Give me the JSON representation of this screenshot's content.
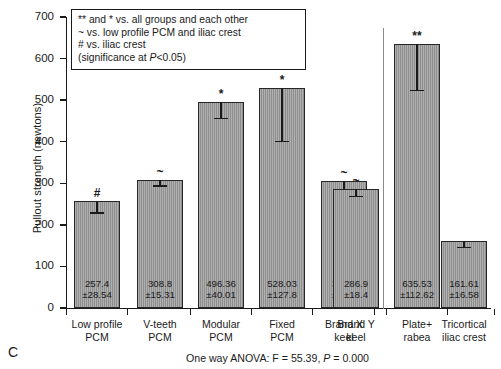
{
  "panel": {
    "letter": "C"
  },
  "chart_data": {
    "type": "bar",
    "title": "",
    "xlabel": "",
    "ylabel": "Pullout strength (newtons)",
    "ylim": [
      0,
      700
    ],
    "ytick_step": 100,
    "yticks": [
      0,
      100,
      200,
      300,
      400,
      500,
      600,
      700
    ],
    "grid": false,
    "legend_position": "none",
    "categories": [
      "Low profile\nPCM",
      "V-teeth\nPCM",
      "Modular\nPCM",
      "Fixed\nPCM",
      "Brand X\nkeel",
      "Brand Y\nkeel",
      "Plate+\nrabea",
      "Tricortical\niliac crest"
    ],
    "values": [
      257.4,
      308.8,
      496.36,
      528.03,
      306.4,
      286.9,
      635.53,
      161.61
    ],
    "errors": [
      28.54,
      15.31,
      40.01,
      127.8,
      31.3,
      18.4,
      112.62,
      16.58
    ],
    "value_labels": [
      "257.4\n±28.54",
      "308.8\n±15.31",
      "496.36\n±40.01",
      "528.03\n±127.8",
      "306.4\n±31.3",
      "286.9\n±18.4",
      "635.53\n±112.62",
      "161.61\n±16.58"
    ],
    "significance_markers": [
      "#",
      "~",
      "*",
      "*",
      "~",
      "~",
      "**",
      ""
    ],
    "series": [
      {
        "name": "Pullout strength",
        "values": [
          257.4,
          308.8,
          496.36,
          528.03,
          306.4,
          286.9,
          635.53,
          161.61
        ]
      }
    ],
    "annotations": {
      "divider_after_category_index": 5,
      "anova": "One way ANOVA: F = 55.39, P = 0.000"
    }
  },
  "notes_box": {
    "lines": [
      "** and * vs. all groups and each other",
      "~ vs. low profile PCM and iliac crest",
      "# vs. iliac crest",
      "(significance at P<0.05)"
    ],
    "line_1": "** and * vs. all groups and each other",
    "line_2": "~ vs. low profile PCM and iliac crest",
    "line_3": "# vs. iliac crest",
    "line_4_pre": "(significance at ",
    "line_4_italic": "P",
    "line_4_post": "<0.05)"
  },
  "footer": {
    "anova_pre": "One way ANOVA: F = 55.39, ",
    "anova_italic": "P",
    "anova_post": " = 0.000"
  },
  "axis": {
    "y_label": "Pullout strength (newtons)",
    "y_tick_labels": [
      "700",
      "600",
      "500",
      "400",
      "300",
      "200",
      "100",
      "0"
    ]
  }
}
